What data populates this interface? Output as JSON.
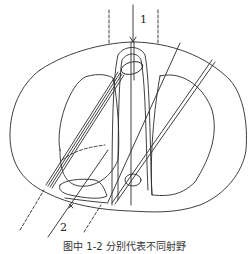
{
  "figure": {
    "labels": {
      "beam_1": "1",
      "beam_2": "2"
    },
    "caption": "图中 1-2 分别代表不同射野",
    "colors": {
      "line": "#2a2a2a",
      "background": "#ffffff"
    }
  }
}
